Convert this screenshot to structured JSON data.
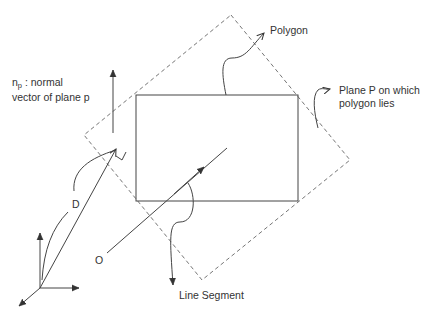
{
  "diagram": {
    "labels": {
      "normal_line1": "n",
      "normal_sub": "p",
      "normal_line1_rest": " : normal",
      "normal_line2": "vector of plane p",
      "polygon": "Polygon",
      "plane_line1": "Plane P on which",
      "plane_line2": "polygon lies",
      "distance": "D",
      "origin": "O",
      "segment": "Line Segment"
    },
    "elements": [
      {
        "name": "plane-p",
        "style": "dashed",
        "shape": "quadrilateral"
      },
      {
        "name": "polygon",
        "style": "solid",
        "shape": "rectangle"
      },
      {
        "name": "normal-vector",
        "style": "arrow"
      },
      {
        "name": "distance-vector",
        "style": "arrow",
        "label": "D"
      },
      {
        "name": "line-segment",
        "style": "arrow",
        "from": "O"
      },
      {
        "name": "coordinate-axes",
        "axes": 3
      }
    ],
    "colors": {
      "line": "#444444",
      "dashed": "#666666",
      "text": "#333333",
      "background": "#ffffff"
    }
  }
}
